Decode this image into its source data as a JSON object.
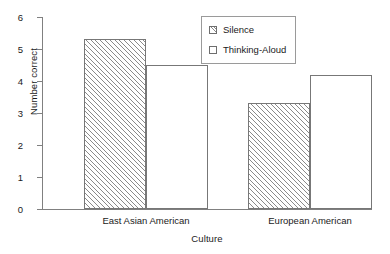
{
  "chart_data": {
    "type": "bar",
    "title": "",
    "xlabel": "Culture",
    "ylabel": "Number correct",
    "categories": [
      "East Asian American",
      "European American"
    ],
    "series": [
      {
        "name": "Silence",
        "values": [
          5.3,
          3.3
        ],
        "fill": "hatched"
      },
      {
        "name": "Thinking-Aloud",
        "values": [
          4.5,
          4.2
        ],
        "fill": "white"
      }
    ],
    "ylim": [
      0,
      6
    ],
    "yticks": [
      0,
      1,
      2,
      3,
      4,
      5,
      6
    ],
    "ytick_labels": [
      "0",
      "1",
      "2",
      "3",
      "4",
      "5",
      "6"
    ],
    "grid": false,
    "legend_position": "top-center-right",
    "colors": {
      "axis": "#808080",
      "bar_edge": "#777777",
      "hatch": "#8a8a8a",
      "background": "#ffffff",
      "text": "#1a1a1a"
    }
  },
  "legend": {
    "items": [
      {
        "label": "Silence"
      },
      {
        "label": "Thinking-Aloud"
      }
    ]
  }
}
